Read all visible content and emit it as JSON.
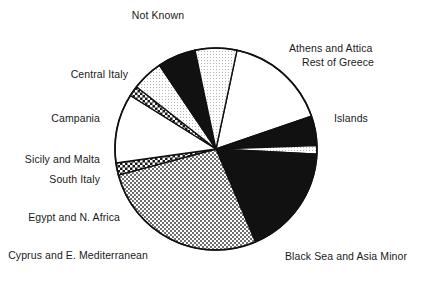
{
  "chart_data": {
    "type": "pie",
    "title": "",
    "subtitle": "",
    "xlabel": "",
    "ylabel": "",
    "legend_position": "callout-labels",
    "grid": false,
    "total_degrees": 360,
    "center": {
      "x": 216,
      "y": 149
    },
    "radius": 101,
    "start_angle_deg": -78,
    "direction": "clockwise",
    "categories": [
      "Not Known",
      "Athens and Attica",
      "Rest of Greece",
      "Islands",
      "Black Sea and Asia Minor",
      "Cyprus and E. Mediterranean",
      "Egypt and N. Africa",
      "South Italy",
      "Sicily and Malta",
      "Campania",
      "Central Italy"
    ],
    "values": [
      16.4,
      4.7,
      1.4,
      17.8,
      27.2,
      1.9,
      11.1,
      1.7,
      5.0,
      6.1,
      6.7
    ],
    "units": "percent",
    "slices": [
      {
        "label": "Not Known",
        "value": 16.4,
        "angle_deg": 59.0,
        "fill": "white",
        "fill_hex": "#ffffff"
      },
      {
        "label": "Athens and Attica",
        "value": 4.7,
        "angle_deg": 17.0,
        "fill": "black",
        "fill_hex": "#111111"
      },
      {
        "label": "Rest of Greece",
        "value": 1.4,
        "angle_deg": 5.0,
        "fill": "light-stipple",
        "fill_hex": "#f2f2f2"
      },
      {
        "label": "Islands",
        "value": 17.8,
        "angle_deg": 64.0,
        "fill": "black",
        "fill_hex": "#111111"
      },
      {
        "label": "Black Sea and Asia Minor",
        "value": 27.2,
        "angle_deg": 98.0,
        "fill": "fine-check",
        "fill_hex": "#c9c9c9"
      },
      {
        "label": "Cyprus and E. Mediterranean",
        "value": 1.9,
        "angle_deg": 7.0,
        "fill": "coarse-check",
        "fill_hex": "#4a4a4a"
      },
      {
        "label": "Egypt and N. Africa",
        "value": 11.1,
        "angle_deg": 40.0,
        "fill": "white",
        "fill_hex": "#ffffff"
      },
      {
        "label": "South Italy",
        "value": 1.7,
        "angle_deg": 6.0,
        "fill": "coarse-check",
        "fill_hex": "#4a4a4a"
      },
      {
        "label": "Sicily and Malta",
        "value": 5.0,
        "angle_deg": 18.0,
        "fill": "light-stipple",
        "fill_hex": "#f0f0f0"
      },
      {
        "label": "Campania",
        "value": 6.1,
        "angle_deg": 22.0,
        "fill": "black",
        "fill_hex": "#111111"
      },
      {
        "label": "Central Italy",
        "value": 6.7,
        "angle_deg": 24.0,
        "fill": "light-stipple",
        "fill_hex": "#f0f0f0"
      }
    ],
    "labels": [
      {
        "text": "Not Known",
        "x": 158,
        "y": 9,
        "align": "center"
      },
      {
        "text": "Athens and Attica",
        "x": 289,
        "y": 42,
        "align": "left"
      },
      {
        "text": "Rest of Greece",
        "x": 302,
        "y": 56,
        "align": "left"
      },
      {
        "text": "Islands",
        "x": 334,
        "y": 112,
        "align": "left"
      },
      {
        "text": "Black Sea and Asia Minor",
        "x": 285,
        "y": 250,
        "align": "left"
      },
      {
        "text": "Cyprus and E. Mediterranean",
        "x": 148,
        "y": 249,
        "align": "right"
      },
      {
        "text": "Egypt and N. Africa",
        "x": 120,
        "y": 211,
        "align": "right"
      },
      {
        "text": "South Italy",
        "x": 100,
        "y": 173,
        "align": "right"
      },
      {
        "text": "Sicily and Malta",
        "x": 100,
        "y": 153,
        "align": "right"
      },
      {
        "text": "Campania",
        "x": 100,
        "y": 112,
        "align": "right"
      },
      {
        "text": "Central Italy",
        "x": 128,
        "y": 68,
        "align": "right"
      }
    ]
  },
  "colors": {
    "outline": "#111111",
    "background": "#ffffff",
    "text": "#1a1a1a"
  }
}
